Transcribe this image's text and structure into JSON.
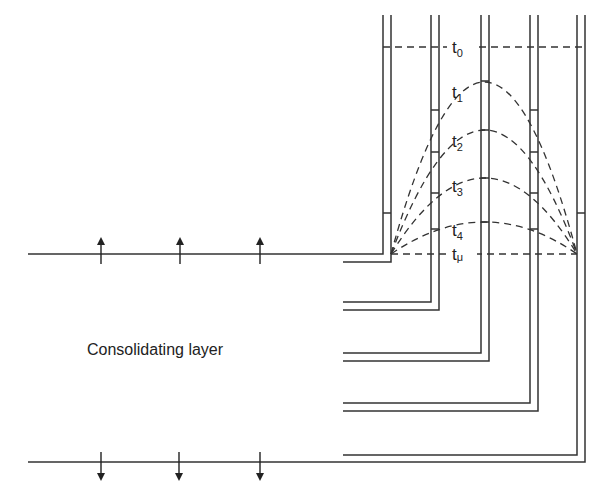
{
  "diagram": {
    "layer_label": "Consolidating layer",
    "isochrones": [
      {
        "name": "t",
        "sub": "0",
        "peak_y": 47
      },
      {
        "name": "t",
        "sub": "1",
        "peak_y": 81
      },
      {
        "name": "t",
        "sub": "2",
        "peak_y": 130
      },
      {
        "name": "t",
        "sub": "3",
        "peak_y": 178
      },
      {
        "name": "t",
        "sub": "4",
        "peak_y": 222
      },
      {
        "name": "t",
        "sub": "μ",
        "peak_y": 254
      }
    ],
    "flow_arrows_top": "up",
    "flow_arrows_bottom": "down",
    "line_color": "#333333"
  }
}
